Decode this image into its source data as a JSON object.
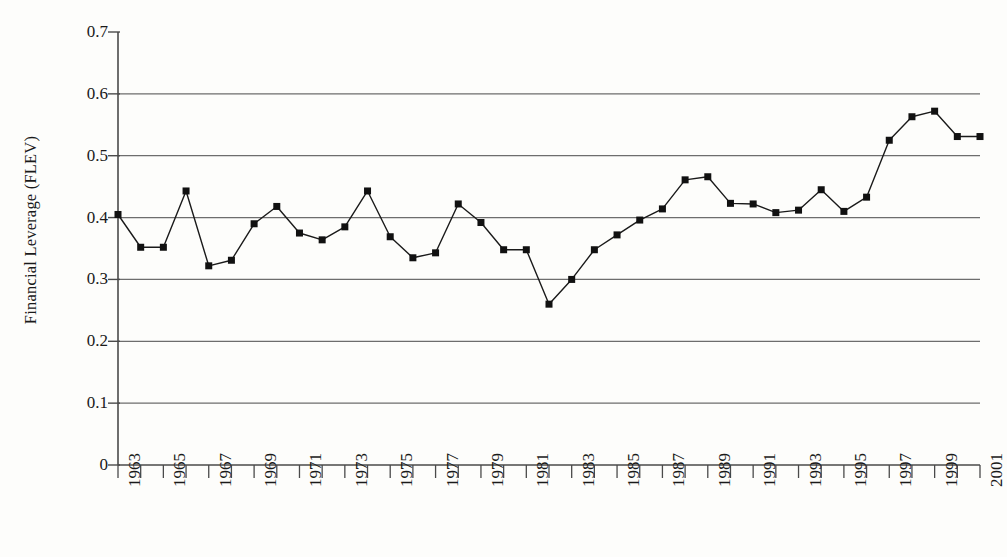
{
  "chart_data": {
    "type": "line",
    "title": "",
    "xlabel": "",
    "ylabel": "Financial Leverage (FLEV)",
    "xlim": [
      1963,
      2001
    ],
    "ylim": [
      0,
      0.7
    ],
    "grid": "horizontal",
    "legend": "none",
    "marker": "square",
    "y_ticks": [
      0,
      0.1,
      0.2,
      0.3,
      0.4,
      0.5,
      0.6,
      0.7
    ],
    "y_tick_labels": [
      "0",
      "0.1",
      "0.2",
      "0.3",
      "0.4",
      "0.5",
      "0.6",
      "0.7"
    ],
    "x_ticks": [
      1963,
      1964,
      1965,
      1966,
      1967,
      1968,
      1969,
      1970,
      1971,
      1972,
      1973,
      1974,
      1975,
      1976,
      1977,
      1978,
      1979,
      1980,
      1981,
      1982,
      1983,
      1984,
      1985,
      1986,
      1987,
      1988,
      1989,
      1990,
      1991,
      1992,
      1993,
      1994,
      1995,
      1996,
      1997,
      1998,
      1999,
      2000,
      2001
    ],
    "x_tick_labels": [
      "1963",
      "",
      "1965",
      "",
      "1967",
      "",
      "1969",
      "",
      "1971",
      "",
      "1973",
      "",
      "1975",
      "",
      "1977",
      "",
      "1979",
      "",
      "1981",
      "",
      "1983",
      "",
      "1985",
      "",
      "1987",
      "",
      "1989",
      "",
      "1991",
      "",
      "1993",
      "",
      "1995",
      "",
      "1997",
      "",
      "1999",
      "",
      "2001"
    ],
    "x": [
      1963,
      1964,
      1965,
      1966,
      1967,
      1968,
      1969,
      1970,
      1971,
      1972,
      1973,
      1974,
      1975,
      1976,
      1977,
      1978,
      1979,
      1980,
      1981,
      1982,
      1983,
      1984,
      1985,
      1986,
      1987,
      1988,
      1989,
      1990,
      1991,
      1992,
      1993,
      1994,
      1995,
      1996,
      1997,
      1998,
      1999,
      2000,
      2001
    ],
    "values": [
      0.405,
      0.352,
      0.352,
      0.443,
      0.322,
      0.331,
      0.39,
      0.418,
      0.375,
      0.364,
      0.385,
      0.443,
      0.369,
      0.335,
      0.343,
      0.422,
      0.392,
      0.348,
      0.26,
      0.3,
      0.348,
      0.372,
      0.396,
      0.414,
      0.461,
      0.466,
      0.423,
      0.422,
      0.408,
      0.412,
      0.445,
      0.41,
      0.433,
      0.525,
      0.563,
      0.572,
      0.531,
      0.0,
      0.0
    ],
    "series": [
      {
        "name": "FLEV",
        "points": [
          {
            "year": 1963,
            "value": 0.405
          },
          {
            "year": 1964,
            "value": 0.352
          },
          {
            "year": 1965,
            "value": 0.352
          },
          {
            "year": 1966,
            "value": 0.443
          },
          {
            "year": 1967,
            "value": 0.322
          },
          {
            "year": 1968,
            "value": 0.331
          },
          {
            "year": 1969,
            "value": 0.39
          },
          {
            "year": 1970,
            "value": 0.418
          },
          {
            "year": 1971,
            "value": 0.375
          },
          {
            "year": 1972,
            "value": 0.364
          },
          {
            "year": 1973,
            "value": 0.385
          },
          {
            "year": 1974,
            "value": 0.443
          },
          {
            "year": 1975,
            "value": 0.369
          },
          {
            "year": 1976,
            "value": 0.335
          },
          {
            "year": 1977,
            "value": 0.343
          },
          {
            "year": 1978,
            "value": 0.422
          },
          {
            "year": 1979,
            "value": 0.392
          },
          {
            "year": 1980,
            "value": 0.348
          },
          {
            "year": 1981,
            "value": 0.348
          },
          {
            "year": 1982,
            "value": 0.26
          },
          {
            "year": 1983,
            "value": 0.3
          },
          {
            "year": 1984,
            "value": 0.348
          },
          {
            "year": 1985,
            "value": 0.372
          },
          {
            "year": 1986,
            "value": 0.396
          },
          {
            "year": 1987,
            "value": 0.414
          },
          {
            "year": 1988,
            "value": 0.461
          },
          {
            "year": 1989,
            "value": 0.466
          },
          {
            "year": 1990,
            "value": 0.423
          },
          {
            "year": 1991,
            "value": 0.422
          },
          {
            "year": 1992,
            "value": 0.408
          },
          {
            "year": 1993,
            "value": 0.412
          },
          {
            "year": 1994,
            "value": 0.445
          },
          {
            "year": 1995,
            "value": 0.41
          },
          {
            "year": 1996,
            "value": 0.433
          },
          {
            "year": 1997,
            "value": 0.525
          },
          {
            "year": 1998,
            "value": 0.563
          },
          {
            "year": 1999,
            "value": 0.572
          },
          {
            "year": 2000,
            "value": 0.531
          },
          {
            "year": 2001,
            "value": 0.531
          }
        ]
      }
    ],
    "colors": {
      "line": "#1a1a1a",
      "marker": "#111111",
      "grid": "#6d6d6d",
      "axis": "#4a4a4a",
      "background": "#fdfdfb"
    }
  }
}
